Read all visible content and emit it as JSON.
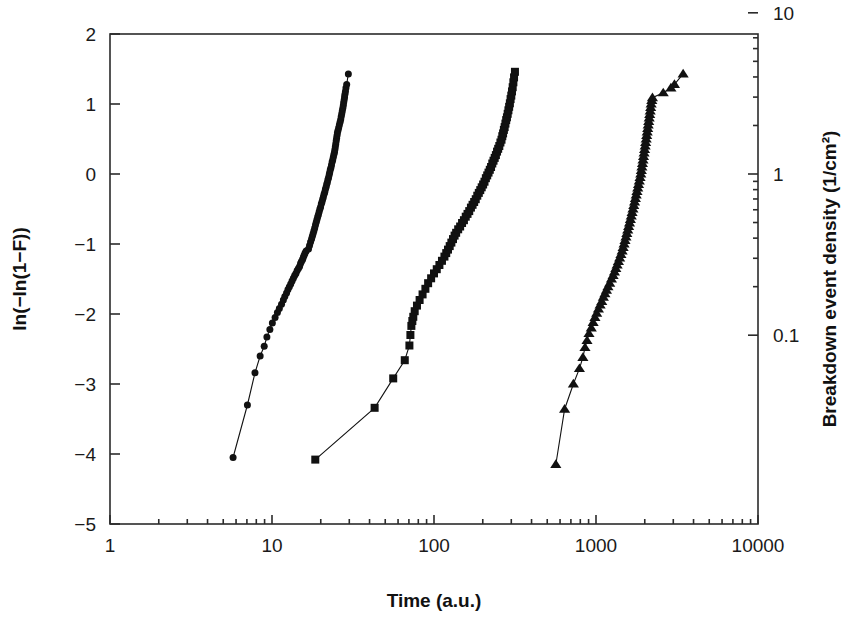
{
  "chart_data": {
    "type": "scatter",
    "title": "",
    "xlabel": "Time (a.u.)",
    "ylabel": "ln(−ln(1−F))",
    "y2label": "Breakdown event density (1/cm²)",
    "xscale": "log",
    "yscale": "linear",
    "y2scale": "log",
    "xlim": [
      1,
      10000
    ],
    "ylim": [
      -5,
      2
    ],
    "y2lim": [
      0.00673794699,
      7.389056099
    ],
    "grid": false,
    "legend": null,
    "xticks": [
      1,
      10,
      100,
      1000,
      10000
    ],
    "xticklabels": [
      "1",
      "10",
      "100",
      "1000",
      "10000"
    ],
    "yticks": [
      2,
      1,
      0,
      -1,
      -2,
      -3,
      -4,
      -5
    ],
    "yticklabels": [
      "2",
      "1",
      "0",
      "-1",
      "-2",
      "-3",
      "-4",
      "-5"
    ],
    "y2ticks": [
      50,
      10,
      1,
      0.1
    ],
    "y2ticklabels": [
      "50",
      "10",
      "1",
      "0.1"
    ],
    "series": [
      {
        "name": "sample-1",
        "marker": "circle",
        "marker_size": 7,
        "color": "#111111",
        "points": [
          [
            5.75,
            -4.05
          ],
          [
            7.05,
            -3.3
          ],
          [
            7.85,
            -2.84
          ],
          [
            8.45,
            -2.6
          ],
          [
            8.95,
            -2.46
          ],
          [
            9.3,
            -2.33
          ],
          [
            9.7,
            -2.22
          ],
          [
            10.05,
            -2.13
          ],
          [
            10.45,
            -2.05
          ],
          [
            10.8,
            -1.98
          ],
          [
            11.1,
            -1.92
          ],
          [
            11.45,
            -1.86
          ],
          [
            11.75,
            -1.8
          ],
          [
            12.0,
            -1.75
          ],
          [
            12.3,
            -1.7
          ],
          [
            12.55,
            -1.65
          ],
          [
            12.8,
            -1.61
          ],
          [
            13.05,
            -1.57
          ],
          [
            13.3,
            -1.53
          ],
          [
            13.55,
            -1.49
          ],
          [
            13.8,
            -1.45
          ],
          [
            14.05,
            -1.42
          ],
          [
            14.3,
            -1.38
          ],
          [
            14.55,
            -1.35
          ],
          [
            14.8,
            -1.32
          ],
          [
            15.0,
            -1.28
          ],
          [
            15.2,
            -1.25
          ],
          [
            15.45,
            -1.22
          ],
          [
            15.6,
            -1.19
          ],
          [
            15.8,
            -1.16
          ],
          [
            16.0,
            -1.13
          ],
          [
            16.25,
            -1.1
          ],
          [
            16.8,
            -1.07
          ],
          [
            17.05,
            -1.02
          ],
          [
            17.3,
            -0.97
          ],
          [
            17.55,
            -0.93
          ],
          [
            17.75,
            -0.89
          ],
          [
            17.95,
            -0.85
          ],
          [
            18.15,
            -0.81
          ],
          [
            18.35,
            -0.77
          ],
          [
            18.55,
            -0.73
          ],
          [
            18.75,
            -0.69
          ],
          [
            18.95,
            -0.65
          ],
          [
            19.15,
            -0.61
          ],
          [
            19.35,
            -0.58
          ],
          [
            19.55,
            -0.54
          ],
          [
            19.75,
            -0.5
          ],
          [
            19.95,
            -0.47
          ],
          [
            20.15,
            -0.43
          ],
          [
            20.35,
            -0.4
          ],
          [
            20.55,
            -0.36
          ],
          [
            20.75,
            -0.33
          ],
          [
            20.95,
            -0.29
          ],
          [
            21.15,
            -0.26
          ],
          [
            21.35,
            -0.22
          ],
          [
            21.55,
            -0.19
          ],
          [
            21.75,
            -0.15
          ],
          [
            21.95,
            -0.12
          ],
          [
            22.15,
            -0.08
          ],
          [
            22.35,
            -0.05
          ],
          [
            22.55,
            -0.01
          ],
          [
            22.7,
            0.02
          ],
          [
            22.9,
            0.06
          ],
          [
            23.1,
            0.09
          ],
          [
            23.3,
            0.13
          ],
          [
            23.5,
            0.17
          ],
          [
            23.7,
            0.2
          ],
          [
            23.9,
            0.24
          ],
          [
            24.1,
            0.28
          ],
          [
            24.3,
            0.31
          ],
          [
            24.45,
            0.35
          ],
          [
            24.6,
            0.39
          ],
          [
            24.75,
            0.43
          ],
          [
            24.9,
            0.47
          ],
          [
            25.05,
            0.51
          ],
          [
            25.2,
            0.55
          ],
          [
            25.35,
            0.59
          ],
          [
            25.55,
            0.62
          ],
          [
            25.8,
            0.66
          ],
          [
            26.05,
            0.7
          ],
          [
            26.3,
            0.74
          ],
          [
            26.55,
            0.78
          ],
          [
            26.75,
            0.82
          ],
          [
            26.95,
            0.86
          ],
          [
            27.15,
            0.9
          ],
          [
            27.35,
            0.94
          ],
          [
            27.55,
            0.98
          ],
          [
            27.7,
            1.02
          ],
          [
            27.9,
            1.06
          ],
          [
            28.05,
            1.1
          ],
          [
            28.2,
            1.14
          ],
          [
            28.4,
            1.18
          ],
          [
            28.6,
            1.23
          ],
          [
            28.9,
            1.28
          ],
          [
            29.6,
            1.43
          ]
        ]
      },
      {
        "name": "sample-2",
        "marker": "square",
        "marker_size": 8,
        "color": "#111111",
        "points": [
          [
            18.5,
            -4.08
          ],
          [
            43.0,
            -3.34
          ],
          [
            56.0,
            -2.92
          ],
          [
            66.0,
            -2.66
          ],
          [
            70.5,
            -2.45
          ],
          [
            71.5,
            -2.3
          ],
          [
            72.5,
            -2.17
          ],
          [
            73.5,
            -2.1
          ],
          [
            74.5,
            -2.04
          ],
          [
            76.0,
            -1.96
          ],
          [
            78.5,
            -1.88
          ],
          [
            81.5,
            -1.8
          ],
          [
            85.0,
            -1.72
          ],
          [
            88.5,
            -1.64
          ],
          [
            92.0,
            -1.56
          ],
          [
            96.0,
            -1.49
          ],
          [
            100.0,
            -1.42
          ],
          [
            104.0,
            -1.36
          ],
          [
            108.0,
            -1.3
          ],
          [
            112.0,
            -1.24
          ],
          [
            116.0,
            -1.18
          ],
          [
            119.0,
            -1.13
          ],
          [
            122.0,
            -1.08
          ],
          [
            125.0,
            -1.03
          ],
          [
            128.0,
            -0.98
          ],
          [
            131.0,
            -0.93
          ],
          [
            134.0,
            -0.88
          ],
          [
            137.0,
            -0.84
          ],
          [
            141.0,
            -0.79
          ],
          [
            145.0,
            -0.75
          ],
          [
            149.0,
            -0.7
          ],
          [
            153.0,
            -0.66
          ],
          [
            157.0,
            -0.61
          ],
          [
            161.0,
            -0.57
          ],
          [
            165.0,
            -0.53
          ],
          [
            169.0,
            -0.48
          ],
          [
            173.0,
            -0.44
          ],
          [
            177.0,
            -0.4
          ],
          [
            181.0,
            -0.36
          ],
          [
            185.0,
            -0.31
          ],
          [
            189.0,
            -0.27
          ],
          [
            193.0,
            -0.23
          ],
          [
            197.0,
            -0.19
          ],
          [
            201.0,
            -0.15
          ],
          [
            205.0,
            -0.11
          ],
          [
            209.0,
            -0.06
          ],
          [
            213.0,
            -0.02
          ],
          [
            217.0,
            0.02
          ],
          [
            221.0,
            0.06
          ],
          [
            225.0,
            0.1
          ],
          [
            229.0,
            0.15
          ],
          [
            233.0,
            0.19
          ],
          [
            237.0,
            0.23
          ],
          [
            241.0,
            0.27
          ],
          [
            245.0,
            0.32
          ],
          [
            249.0,
            0.36
          ],
          [
            253.0,
            0.4
          ],
          [
            257.0,
            0.45
          ],
          [
            261.0,
            0.49
          ],
          [
            264.0,
            0.54
          ],
          [
            267.0,
            0.58
          ],
          [
            270.0,
            0.63
          ],
          [
            273.0,
            0.67
          ],
          [
            276.0,
            0.72
          ],
          [
            279.0,
            0.77
          ],
          [
            282.0,
            0.81
          ],
          [
            285.0,
            0.86
          ],
          [
            288.0,
            0.91
          ],
          [
            291.0,
            0.96
          ],
          [
            294.0,
            1.01
          ],
          [
            297.0,
            1.07
          ],
          [
            300.0,
            1.12
          ],
          [
            303.0,
            1.18
          ],
          [
            306.0,
            1.24
          ],
          [
            309.0,
            1.31
          ],
          [
            312.0,
            1.38
          ],
          [
            316.0,
            1.46
          ]
        ]
      },
      {
        "name": "sample-3",
        "marker": "triangle",
        "marker_size": 9,
        "color": "#111111",
        "points": [
          [
            565.0,
            -4.15
          ],
          [
            640.0,
            -3.36
          ],
          [
            725.0,
            -3.0
          ],
          [
            790.0,
            -2.78
          ],
          [
            830.0,
            -2.62
          ],
          [
            855.0,
            -2.48
          ],
          [
            880.0,
            -2.38
          ],
          [
            905.0,
            -2.28
          ],
          [
            935.0,
            -2.2
          ],
          [
            960.0,
            -2.12
          ],
          [
            985.0,
            -2.05
          ],
          [
            1010.0,
            -1.99
          ],
          [
            1035.0,
            -1.93
          ],
          [
            1060.0,
            -1.87
          ],
          [
            1085.0,
            -1.82
          ],
          [
            1110.0,
            -1.76
          ],
          [
            1135.0,
            -1.71
          ],
          [
            1160.0,
            -1.66
          ],
          [
            1185.0,
            -1.61
          ],
          [
            1215.0,
            -1.56
          ],
          [
            1245.0,
            -1.5
          ],
          [
            1275.0,
            -1.45
          ],
          [
            1300.0,
            -1.4
          ],
          [
            1325.0,
            -1.35
          ],
          [
            1350.0,
            -1.3
          ],
          [
            1375.0,
            -1.25
          ],
          [
            1400.0,
            -1.2
          ],
          [
            1425.0,
            -1.15
          ],
          [
            1450.0,
            -1.1
          ],
          [
            1470.0,
            -1.05
          ],
          [
            1490.0,
            -1.0
          ],
          [
            1510.0,
            -0.95
          ],
          [
            1530.0,
            -0.9
          ],
          [
            1550.0,
            -0.85
          ],
          [
            1570.0,
            -0.8
          ],
          [
            1590.0,
            -0.75
          ],
          [
            1610.0,
            -0.7
          ],
          [
            1630.0,
            -0.65
          ],
          [
            1650.0,
            -0.6
          ],
          [
            1670.0,
            -0.55
          ],
          [
            1690.0,
            -0.5
          ],
          [
            1710.0,
            -0.45
          ],
          [
            1730.0,
            -0.4
          ],
          [
            1750.0,
            -0.35
          ],
          [
            1770.0,
            -0.3
          ],
          [
            1790.0,
            -0.25
          ],
          [
            1810.0,
            -0.2
          ],
          [
            1830.0,
            -0.15
          ],
          [
            1850.0,
            -0.1
          ],
          [
            1870.0,
            -0.05
          ],
          [
            1890.0,
            0.0
          ],
          [
            1905.0,
            0.05
          ],
          [
            1920.0,
            0.1
          ],
          [
            1935.0,
            0.15
          ],
          [
            1950.0,
            0.2
          ],
          [
            1965.0,
            0.25
          ],
          [
            1980.0,
            0.3
          ],
          [
            1995.0,
            0.35
          ],
          [
            2010.0,
            0.4
          ],
          [
            2025.0,
            0.45
          ],
          [
            2040.0,
            0.5
          ],
          [
            2055.0,
            0.55
          ],
          [
            2070.0,
            0.6
          ],
          [
            2085.0,
            0.65
          ],
          [
            2100.0,
            0.7
          ],
          [
            2115.0,
            0.75
          ],
          [
            2130.0,
            0.8
          ],
          [
            2145.0,
            0.85
          ],
          [
            2160.0,
            0.9
          ],
          [
            2175.0,
            0.95
          ],
          [
            2190.0,
            1.0
          ],
          [
            2210.0,
            1.05
          ],
          [
            2230.0,
            1.09
          ],
          [
            2600.0,
            1.16
          ],
          [
            2900.0,
            1.23
          ],
          [
            3050.0,
            1.28
          ],
          [
            3450.0,
            1.43
          ]
        ]
      }
    ]
  }
}
